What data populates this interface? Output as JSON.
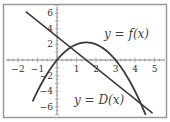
{
  "chart_data": {
    "type": "line",
    "title": "",
    "xlabel": "",
    "ylabel": "",
    "xlim": [
      -2.6,
      5.7
    ],
    "ylim": [
      -7.3,
      7.2
    ],
    "x_ticks": [
      -2,
      -1,
      1,
      2,
      3,
      4,
      5
    ],
    "y_ticks": [
      6,
      4,
      2,
      -2,
      -4,
      -6
    ],
    "grid": false,
    "series": [
      {
        "name": "y = f(x)",
        "kind": "line",
        "formula": "-2x + 3",
        "x": [
          -1.6,
          4.9
        ],
        "y": [
          6.2,
          -6.8
        ]
      },
      {
        "name": "y = D(x)",
        "kind": "parabola",
        "formula": "-x^2 + 3x",
        "x": [
          -1.25,
          -1,
          0,
          1,
          1.5,
          2,
          3,
          4,
          4.55
        ],
        "y": [
          -5.3,
          -4,
          0,
          2,
          2.25,
          2,
          0,
          -4,
          -7.05
        ]
      }
    ],
    "annotations": [
      {
        "text": "y = f(x)",
        "x": 3.6,
        "y": 3.3
      },
      {
        "text": "y = D(x)",
        "x": 2.4,
        "y": -5.2
      }
    ]
  },
  "labels": {
    "f": "y = f(x)",
    "D": "y = D(x)"
  },
  "colors": {
    "curve": "#3a3a3a",
    "axis": "#888888",
    "frame": "#999999"
  }
}
